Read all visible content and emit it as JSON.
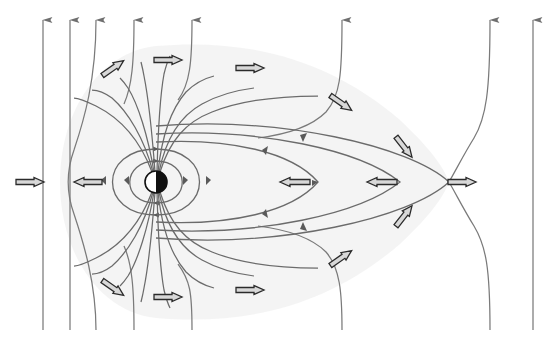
{
  "figure": {
    "width": 552,
    "height": 350,
    "background_color": "#ffffff"
  },
  "colors": {
    "field_line": "#6b6b6b",
    "field_line_dark": "#5a5a5a",
    "vertical_line": "#7a7a7a",
    "arrow_fill": "#d8d8d8",
    "arrow_stroke": "#2b2b2b",
    "body_dark": "#111111",
    "body_light": "#ffffff",
    "shading": "#f0f0f0"
  },
  "central_body": {
    "name": "planet",
    "cx": 156,
    "cy": 182,
    "r": 11,
    "left_half_color": "#ffffff",
    "right_half_color": "#111111",
    "outline_color": "#111111"
  },
  "neutral_points": [
    {
      "name": "sunward-neutral-point",
      "x": 58,
      "y": 182
    },
    {
      "name": "tail-neutral-point",
      "x": 449,
      "y": 182
    }
  ],
  "vertical_field_lines": {
    "description": "Interplanetary field lines running top to bottom with downward arrowheads",
    "arrowhead_direction": "down",
    "x_positions": [
      43,
      70,
      96,
      134,
      192,
      342,
      490,
      533
    ],
    "top_y": 20,
    "bottom_y": 330
  },
  "closed_field_loops": {
    "description": "Nested closed dipole loops around the central body",
    "count": 2,
    "loop_half_widths": [
      31,
      52
    ],
    "loop_half_heights": [
      21,
      33
    ]
  },
  "tail_field_lines": {
    "description": "Stretched field lines forming the magnetotail toward the right, converging at the tail neutral point",
    "count": 3,
    "tail_tip_x": 449
  },
  "flow_arrows": [
    {
      "name": "flow-arrow-left-inbound",
      "x": 30,
      "y": 182,
      "angle": 0,
      "length": 28,
      "note": "solar wind inflow toward neutral point"
    },
    {
      "name": "flow-arrow-left-outbound",
      "x": 88,
      "y": 182,
      "angle": 180,
      "length": 28,
      "note": "sunward flow away from neutral point"
    },
    {
      "name": "flow-arrow-upper-left-diag",
      "x": 113,
      "y": 68,
      "angle": -35,
      "length": 26
    },
    {
      "name": "flow-arrow-upper-left-horiz",
      "x": 168,
      "y": 60,
      "angle": 0,
      "length": 28
    },
    {
      "name": "flow-arrow-upper-mid",
      "x": 250,
      "y": 68,
      "angle": 0,
      "length": 28
    },
    {
      "name": "flow-arrow-upper-right-diag",
      "x": 341,
      "y": 103,
      "angle": 35,
      "length": 26
    },
    {
      "name": "flow-arrow-upper-xpoint",
      "x": 404,
      "y": 147,
      "angle": 52,
      "length": 26
    },
    {
      "name": "flow-arrow-tail-inner",
      "x": 295,
      "y": 182,
      "angle": 180,
      "length": 30
    },
    {
      "name": "flow-arrow-tail-outer",
      "x": 382,
      "y": 182,
      "angle": 180,
      "length": 30
    },
    {
      "name": "flow-arrow-downstream",
      "x": 462,
      "y": 182,
      "angle": 0,
      "length": 28
    },
    {
      "name": "flow-arrow-lower-xpoint",
      "x": 404,
      "y": 216,
      "angle": -52,
      "length": 26
    },
    {
      "name": "flow-arrow-lower-right-diag",
      "x": 341,
      "y": 258,
      "angle": -35,
      "length": 26
    },
    {
      "name": "flow-arrow-lower-mid",
      "x": 250,
      "y": 290,
      "angle": 0,
      "length": 28
    },
    {
      "name": "flow-arrow-lower-left-horiz",
      "x": 168,
      "y": 297,
      "angle": 0,
      "length": 28
    },
    {
      "name": "flow-arrow-lower-left-diag",
      "x": 113,
      "y": 288,
      "angle": 35,
      "length": 26
    }
  ],
  "line_direction_markers": {
    "description": "Small triangular arrowheads placed along field lines showing circulation sense",
    "count": 10
  }
}
